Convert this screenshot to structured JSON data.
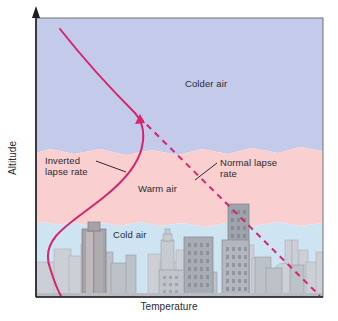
{
  "figure": {
    "type": "diagram",
    "axes": {
      "y_label": "Altitude",
      "x_label": "Temperature",
      "y_arrow": "up-arrow-icon",
      "x_range_shown": false,
      "y_range_shown": false,
      "ticks": false,
      "grid": false
    },
    "layers": [
      {
        "name": "colder-air",
        "label": "Colder air",
        "color": "#c4caea"
      },
      {
        "name": "warm-air",
        "label": "Warm air",
        "color": "#f9cfcf"
      },
      {
        "name": "cold-air",
        "label": "Cold air",
        "color": "#cfe4f2"
      }
    ],
    "curves": [
      {
        "name": "inverted-lapse-rate",
        "label": "Inverted lapse rate",
        "style": "solid",
        "color": "#d6246e"
      },
      {
        "name": "normal-lapse-rate",
        "label": "Normal lapse rate",
        "style": "dashed",
        "color": "#d6246e"
      }
    ],
    "skyline": {
      "name": "city-skyline",
      "back_color": "#c9cdd4",
      "mid_color": "#b5b9c1",
      "front_color": "#9a9ea8",
      "ground_color": "#b9bcc2"
    },
    "frame_color": "#6f7478"
  }
}
